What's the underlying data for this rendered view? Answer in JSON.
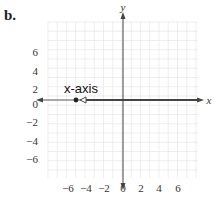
{
  "figure": {
    "panel_label": "b.",
    "annotation": "x-axis",
    "x_axis_name": "x",
    "y_axis_name": "y",
    "x_ticks": [
      "−6",
      "−4",
      "−2",
      "0",
      "2",
      "4",
      "6"
    ],
    "y_ticks": [
      "6",
      "4",
      "2",
      "0",
      "−2",
      "−4",
      "−6"
    ],
    "colors": {
      "grid": "#d9d9d9",
      "axis": "#555555",
      "highlight": "#444444",
      "point": "#222222"
    }
  },
  "chart_data": {
    "type": "scatter",
    "title": "b.",
    "xlabel": "x",
    "ylabel": "y",
    "xlim": [
      -8,
      8
    ],
    "ylim": [
      -8,
      8
    ],
    "grid": true,
    "annotations": [
      "x-axis"
    ],
    "points": [
      {
        "x": -5,
        "y": 0,
        "style": "filled-dot"
      }
    ],
    "rays": [
      {
        "from": [
          -4.5,
          0
        ],
        "direction": "positive-x",
        "label": "x-axis",
        "note": "open arrowhead near x=-4.5 pointing left, line highlighted along x-axis to the right"
      }
    ]
  }
}
